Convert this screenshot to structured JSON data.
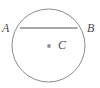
{
  "figure": {
    "type": "geometry-diagram",
    "background_color": "#ffffff",
    "stroke_color": "#8c8c8c",
    "label_color": "#4a4a4a",
    "center_dot_color": "#909090",
    "labels": {
      "a": "A",
      "b": "B",
      "c": "C"
    },
    "shapes": {
      "circle": {
        "name": "circle-outline",
        "cx": 48.5,
        "cy": 45.5,
        "r": 36.5,
        "stroke_width": 1,
        "fill": "none"
      },
      "chord": {
        "name": "chord-ab",
        "x1": 20.5,
        "y1": 28,
        "x2": 77,
        "y2": 28,
        "stroke_width": 1.6
      },
      "center_dot": {
        "name": "center-point-c",
        "cx": 49,
        "cy": 46,
        "r": 1.9
      }
    }
  }
}
